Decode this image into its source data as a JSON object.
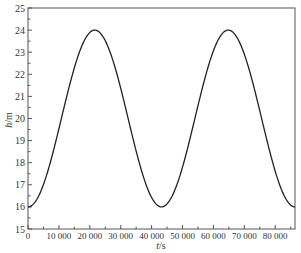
{
  "chart_data": {
    "type": "line",
    "title": "",
    "xlabel": "t/s",
    "ylabel": "h/m",
    "xlim": [
      0,
      86400
    ],
    "ylim": [
      15,
      25
    ],
    "grid": false,
    "legend": null,
    "x_ticks": [
      0,
      10000,
      20000,
      30000,
      40000,
      50000,
      60000,
      70000,
      80000
    ],
    "x_tick_labels": [
      "0",
      "10 000",
      "20 000",
      "30 000",
      "40 000",
      "50 000",
      "60 000",
      "70 000",
      "80 000"
    ],
    "y_ticks": [
      15,
      16,
      17,
      18,
      19,
      20,
      21,
      22,
      23,
      24,
      25
    ],
    "y_tick_labels": [
      "15",
      "16",
      "17",
      "18",
      "19",
      "20",
      "21",
      "22",
      "23",
      "24",
      "25"
    ],
    "series": [
      {
        "name": "h(t)",
        "color": "#222222",
        "x": [
          0,
          5400,
          10800,
          16200,
          21600,
          27000,
          32400,
          37800,
          43200,
          48600,
          54000,
          59400,
          64800,
          70200,
          75600,
          81000,
          86400
        ],
        "values": [
          16.0,
          16.59,
          18.0,
          19.41,
          24.0,
          22.83,
          20.0,
          17.17,
          16.0,
          16.59,
          18.0,
          21.41,
          24.0,
          22.83,
          20.0,
          17.17,
          16.0
        ]
      }
    ],
    "model": "h = 20 - 4*cos(2*pi*t/43200)"
  },
  "axes": {
    "x_label_italic": "t",
    "x_label_unit": "/s",
    "y_label_italic": "h",
    "y_label_unit": "/m"
  }
}
